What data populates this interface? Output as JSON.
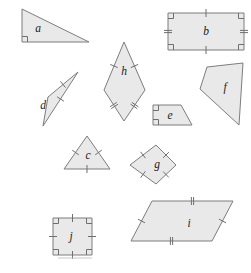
{
  "figure": {
    "width": 251,
    "height": 273,
    "background_color": "#ffffff",
    "shape_fill_color": "#e9e9e9",
    "shape_stroke_color": "#7d7d7d",
    "mark_color": "#6e6e6e",
    "label_color": "#1a1a1a"
  },
  "shapes": [
    {
      "id": "a",
      "label": "a",
      "kind": "right-triangle",
      "points": "22,9 22,42 89,42",
      "label_x": 38,
      "label_y": 29,
      "right_angles": [
        {
          "x": 22,
          "y": 42,
          "dx": 1,
          "dy": -1
        }
      ],
      "ticks": []
    },
    {
      "id": "b",
      "label": "b",
      "kind": "rectangle",
      "points": "168,13 244,13 244,50 168,50",
      "label_x": 206,
      "label_y": 32,
      "right_angles": [
        {
          "x": 168,
          "y": 13,
          "dx": 1,
          "dy": 1
        },
        {
          "x": 244,
          "y": 13,
          "dx": -1,
          "dy": 1
        },
        {
          "x": 244,
          "y": 50,
          "dx": -1,
          "dy": -1
        },
        {
          "x": 168,
          "y": 50,
          "dx": 1,
          "dy": -1
        }
      ],
      "ticks": [
        {
          "x1": 168,
          "y1": 13,
          "x2": 244,
          "y2": 13,
          "count": 1
        },
        {
          "x1": 168,
          "y1": 50,
          "x2": 244,
          "y2": 50,
          "count": 1
        },
        {
          "x1": 168,
          "y1": 13,
          "x2": 168,
          "y2": 50,
          "count": 2
        },
        {
          "x1": 244,
          "y1": 13,
          "x2": 244,
          "y2": 50,
          "count": 2
        }
      ]
    },
    {
      "id": "c",
      "label": "c",
      "kind": "equilateral-triangle",
      "points": "87,136 110,169 64,169",
      "label_x": 88,
      "label_y": 156,
      "right_angles": [],
      "ticks": [
        {
          "x1": 87,
          "y1": 136,
          "x2": 110,
          "y2": 169,
          "count": 1
        },
        {
          "x1": 87,
          "y1": 136,
          "x2": 64,
          "y2": 169,
          "count": 1
        },
        {
          "x1": 64,
          "y1": 169,
          "x2": 110,
          "y2": 169,
          "count": 1
        }
      ]
    },
    {
      "id": "d",
      "label": "d",
      "kind": "triangle",
      "points": "78,72 48,97 43,126",
      "label_x": 43,
      "label_y": 106,
      "right_angles": [],
      "ticks": [
        {
          "x1": 78,
          "y1": 72,
          "x2": 48,
          "y2": 97,
          "count": 1
        },
        {
          "x1": 78,
          "y1": 72,
          "x2": 43,
          "y2": 126,
          "count": 1
        }
      ]
    },
    {
      "id": "e",
      "label": "e",
      "kind": "right-trapezoid",
      "points": "153,105 181,105 192,125 153,125",
      "label_x": 170,
      "label_y": 116,
      "right_angles": [
        {
          "x": 153,
          "y": 105,
          "dx": 1,
          "dy": 1
        },
        {
          "x": 153,
          "y": 125,
          "dx": 1,
          "dy": -1
        }
      ],
      "ticks": []
    },
    {
      "id": "f",
      "label": "f",
      "kind": "quadrilateral",
      "points": "207,67 243,63 239,125 200,89",
      "label_x": 225,
      "label_y": 88,
      "right_angles": [],
      "ticks": []
    },
    {
      "id": "g",
      "label": "g",
      "kind": "rhombus",
      "points": "156,145 176,165 156,184 130,165",
      "label_x": 157,
      "label_y": 165,
      "right_angles": [],
      "ticks": [
        {
          "x1": 156,
          "y1": 145,
          "x2": 176,
          "y2": 165,
          "count": 1
        },
        {
          "x1": 176,
          "y1": 165,
          "x2": 156,
          "y2": 184,
          "count": 1
        },
        {
          "x1": 156,
          "y1": 184,
          "x2": 130,
          "y2": 165,
          "count": 1
        },
        {
          "x1": 130,
          "y1": 165,
          "x2": 156,
          "y2": 145,
          "count": 1
        }
      ]
    },
    {
      "id": "h",
      "label": "h",
      "kind": "kite",
      "points": "124,42 145,90 124,121 104,90",
      "label_x": 124,
      "label_y": 72,
      "right_angles": [],
      "ticks": [
        {
          "x1": 124,
          "y1": 42,
          "x2": 145,
          "y2": 90,
          "count": 1
        },
        {
          "x1": 124,
          "y1": 42,
          "x2": 104,
          "y2": 90,
          "count": 1
        },
        {
          "x1": 145,
          "y1": 90,
          "x2": 124,
          "y2": 121,
          "count": 2
        },
        {
          "x1": 104,
          "y1": 90,
          "x2": 124,
          "y2": 121,
          "count": 2
        }
      ]
    },
    {
      "id": "i",
      "label": "i",
      "kind": "parallelogram",
      "points": "152,201 233,201 212,241 131,241",
      "label_x": 189,
      "label_y": 224,
      "right_angles": [],
      "ticks": [
        {
          "x1": 152,
          "y1": 201,
          "x2": 233,
          "y2": 201,
          "count": 2
        },
        {
          "x1": 131,
          "y1": 241,
          "x2": 212,
          "y2": 241,
          "count": 2
        },
        {
          "x1": 152,
          "y1": 201,
          "x2": 131,
          "y2": 241,
          "count": 1
        },
        {
          "x1": 233,
          "y1": 201,
          "x2": 212,
          "y2": 241,
          "count": 1
        }
      ]
    },
    {
      "id": "j",
      "label": "j",
      "kind": "square",
      "points": "53,218 92,218 92,255 53,255",
      "label_x": 71,
      "label_y": 237,
      "right_angles": [
        {
          "x": 53,
          "y": 218,
          "dx": 1,
          "dy": 1
        },
        {
          "x": 92,
          "y": 218,
          "dx": -1,
          "dy": 1
        },
        {
          "x": 92,
          "y": 255,
          "dx": -1,
          "dy": -1
        },
        {
          "x": 53,
          "y": 255,
          "dx": 1,
          "dy": -1
        }
      ],
      "ticks": [
        {
          "x1": 53,
          "y1": 218,
          "x2": 92,
          "y2": 218,
          "count": 1
        },
        {
          "x1": 53,
          "y1": 255,
          "x2": 92,
          "y2": 255,
          "count": 1
        },
        {
          "x1": 53,
          "y1": 218,
          "x2": 53,
          "y2": 255,
          "count": 1
        },
        {
          "x1": 92,
          "y1": 218,
          "x2": 92,
          "y2": 255,
          "count": 1
        }
      ]
    }
  ],
  "footer_rule": {
    "x1": 58,
    "y1": 258,
    "x2": 92,
    "y2": 258
  }
}
